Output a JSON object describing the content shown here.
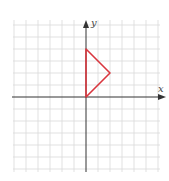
{
  "diagram": {
    "type": "coordinate-plane",
    "x_axis_label": "x",
    "y_axis_label": "y",
    "grid_spacing_px": 12,
    "grid_range": {
      "x": [
        -6,
        6
      ],
      "y": [
        -6,
        6
      ]
    },
    "colors": {
      "grid": "#d9d9d9",
      "axis": "#333333",
      "shape": "#d9363e",
      "background": "#ffffff"
    },
    "shape": {
      "type": "triangle",
      "vertices": [
        [
          0,
          0
        ],
        [
          0,
          4
        ],
        [
          2,
          2
        ]
      ]
    }
  }
}
